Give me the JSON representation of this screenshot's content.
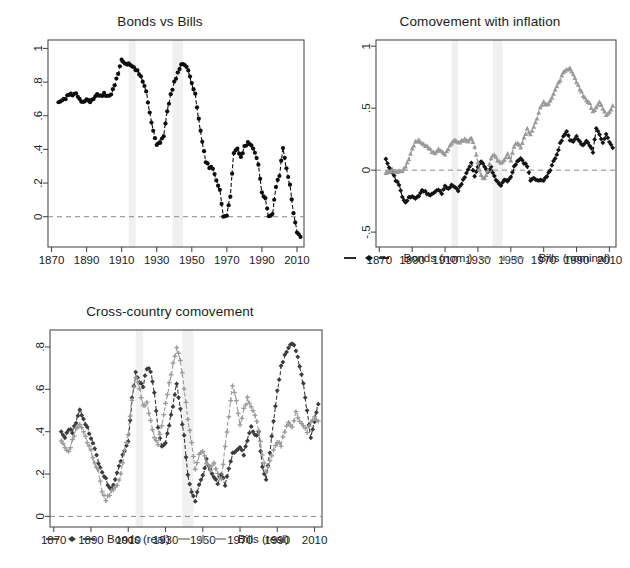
{
  "figure": {
    "panels": [
      "Bonds vs Bills",
      "Comovement with inflation",
      "Cross-country comovement"
    ]
  },
  "panel1": {
    "title": "Bonds vs Bills",
    "ytick_labels": [
      "1",
      ".8",
      ".6",
      ".4",
      ".2",
      "0"
    ],
    "xtick_labels": [
      "1870",
      "1890",
      "1910",
      "1930",
      "1950",
      "1970",
      "1990",
      "2010"
    ]
  },
  "panel2": {
    "title": "Comovement with inflation",
    "ytick_labels": [
      "1",
      ".5",
      "0",
      "-.5"
    ],
    "xtick_labels": [
      "1870",
      "1890",
      "1910",
      "1930",
      "1950",
      "1970",
      "1990",
      "2010"
    ],
    "legend": [
      {
        "label": "Bonds (nom.)",
        "color": "#141414",
        "marker": "diamond"
      },
      {
        "label": "Bills (nominal)",
        "color": "#9a9a9a",
        "marker": "triangle"
      }
    ]
  },
  "panel3": {
    "title": "Cross-country comovement",
    "ytick_labels": [
      ".8",
      ".6",
      ".4",
      ".2",
      "0"
    ],
    "xtick_labels": [
      "1870",
      "1890",
      "1910",
      "1930",
      "1950",
      "1970",
      "1990",
      "2010"
    ],
    "legend": [
      {
        "label": "Bonds (real)",
        "color": "#3c3c3c",
        "marker": "diamond"
      },
      {
        "label": "Bills (real)",
        "color": "#9a9a9a",
        "marker": "plus"
      }
    ]
  },
  "chart_data": [
    {
      "type": "line",
      "id": "bonds-vs-bills",
      "title": "Bonds vs Bills",
      "xlabel": "",
      "ylabel": "",
      "xlim": [
        1868,
        2014
      ],
      "ylim": [
        -0.18,
        1.05
      ],
      "grid": false,
      "legend_position": "none",
      "zero_reference_line": 0,
      "shaded_bands": [
        [
          1914,
          1918
        ],
        [
          1939,
          1945
        ]
      ],
      "series": [
        {
          "name": "Bonds vs Bills correlation",
          "color": "#0d0d0d",
          "marker": "filled-circle",
          "x": [
            1874,
            1876,
            1878,
            1880,
            1882,
            1884,
            1886,
            1888,
            1890,
            1892,
            1894,
            1896,
            1898,
            1900,
            1902,
            1904,
            1906,
            1908,
            1910,
            1912,
            1914,
            1916,
            1918,
            1920,
            1922,
            1924,
            1926,
            1928,
            1930,
            1932,
            1934,
            1936,
            1938,
            1940,
            1942,
            1944,
            1946,
            1948,
            1950,
            1952,
            1954,
            1956,
            1958,
            1960,
            1962,
            1964,
            1966,
            1968,
            1970,
            1972,
            1974,
            1976,
            1978,
            1980,
            1982,
            1984,
            1986,
            1988,
            1990,
            1992,
            1994,
            1996,
            1998,
            2000,
            2002,
            2004,
            2006,
            2008,
            2010,
            2012
          ],
          "y": [
            0.68,
            0.7,
            0.71,
            0.73,
            0.72,
            0.73,
            0.7,
            0.69,
            0.71,
            0.69,
            0.7,
            0.72,
            0.71,
            0.73,
            0.72,
            0.73,
            0.78,
            0.84,
            0.92,
            0.9,
            0.91,
            0.9,
            0.88,
            0.85,
            0.8,
            0.74,
            0.62,
            0.52,
            0.44,
            0.45,
            0.48,
            0.62,
            0.72,
            0.8,
            0.86,
            0.91,
            0.9,
            0.86,
            0.78,
            0.72,
            0.58,
            0.45,
            0.33,
            0.29,
            0.28,
            0.21,
            0.16,
            0.01,
            0.02,
            0.13,
            0.38,
            0.4,
            0.35,
            0.42,
            0.45,
            0.43,
            0.38,
            0.3,
            0.13,
            0.1,
            0.0,
            0.02,
            0.18,
            0.24,
            0.4,
            0.28,
            0.19,
            0.03,
            -0.08,
            -0.12
          ]
        }
      ]
    },
    {
      "type": "line",
      "id": "comovement-with-inflation",
      "title": "Comovement with inflation",
      "xlabel": "",
      "ylabel": "",
      "xlim": [
        1868,
        2014
      ],
      "ylim": [
        -0.62,
        1.05
      ],
      "grid": false,
      "legend_position": "bottom",
      "zero_reference_line": 0,
      "shaded_bands": [
        [
          1914,
          1918
        ],
        [
          1939,
          1945
        ]
      ],
      "series": [
        {
          "name": "Bonds (nom.)",
          "color": "#141414",
          "marker": "filled-diamond",
          "x": [
            1874,
            1876,
            1878,
            1880,
            1882,
            1884,
            1886,
            1888,
            1890,
            1892,
            1894,
            1896,
            1898,
            1900,
            1902,
            1904,
            1906,
            1908,
            1910,
            1912,
            1914,
            1916,
            1918,
            1920,
            1922,
            1924,
            1926,
            1928,
            1930,
            1932,
            1934,
            1936,
            1938,
            1940,
            1942,
            1944,
            1946,
            1948,
            1950,
            1952,
            1954,
            1956,
            1958,
            1960,
            1962,
            1964,
            1966,
            1968,
            1970,
            1972,
            1974,
            1976,
            1978,
            1980,
            1982,
            1984,
            1986,
            1988,
            1990,
            1992,
            1994,
            1996,
            1998,
            2000,
            2002,
            2004,
            2006,
            2008,
            2010,
            2012
          ],
          "y": [
            0.09,
            0.03,
            -0.01,
            -0.08,
            -0.12,
            -0.22,
            -0.26,
            -0.21,
            -0.2,
            -0.22,
            -0.21,
            -0.17,
            -0.18,
            -0.2,
            -0.19,
            -0.17,
            -0.16,
            -0.2,
            -0.14,
            -0.16,
            -0.12,
            -0.13,
            -0.16,
            -0.11,
            -0.06,
            0.0,
            0.06,
            -0.04,
            0.04,
            0.08,
            0.03,
            -0.02,
            0.02,
            -0.05,
            -0.09,
            -0.12,
            -0.08,
            -0.1,
            -0.07,
            0.02,
            0.07,
            0.1,
            0.06,
            0.03,
            -0.09,
            -0.07,
            -0.08,
            -0.07,
            -0.07,
            -0.04,
            0.0,
            0.07,
            0.12,
            0.22,
            0.28,
            0.32,
            0.24,
            0.22,
            0.26,
            0.22,
            0.2,
            0.24,
            0.2,
            0.14,
            0.33,
            0.28,
            0.22,
            0.3,
            0.24,
            0.18
          ]
        },
        {
          "name": "Bills (nominal)",
          "color": "#9a9a9a",
          "marker": "filled-triangle",
          "x": [
            1874,
            1876,
            1878,
            1880,
            1882,
            1884,
            1886,
            1888,
            1890,
            1892,
            1894,
            1896,
            1898,
            1900,
            1902,
            1904,
            1906,
            1908,
            1910,
            1912,
            1914,
            1916,
            1918,
            1920,
            1922,
            1924,
            1926,
            1928,
            1930,
            1932,
            1934,
            1936,
            1938,
            1940,
            1942,
            1944,
            1946,
            1948,
            1950,
            1952,
            1954,
            1956,
            1958,
            1960,
            1962,
            1964,
            1966,
            1968,
            1970,
            1972,
            1974,
            1976,
            1978,
            1980,
            1982,
            1984,
            1986,
            1988,
            1990,
            1992,
            1994,
            1996,
            1998,
            2000,
            2002,
            2004,
            2006,
            2008,
            2010,
            2012
          ],
          "y": [
            -0.02,
            -0.02,
            0.0,
            -0.01,
            0.0,
            0.0,
            0.03,
            0.08,
            0.16,
            0.22,
            0.24,
            0.22,
            0.2,
            0.18,
            0.14,
            0.13,
            0.17,
            0.16,
            0.14,
            0.18,
            0.22,
            0.24,
            0.22,
            0.24,
            0.26,
            0.24,
            0.26,
            0.18,
            0.05,
            -0.05,
            -0.07,
            0.0,
            0.1,
            0.12,
            0.07,
            0.05,
            0.08,
            0.14,
            0.09,
            0.2,
            0.22,
            0.18,
            0.26,
            0.34,
            0.3,
            0.36,
            0.42,
            0.5,
            0.54,
            0.52,
            0.56,
            0.62,
            0.68,
            0.72,
            0.78,
            0.8,
            0.82,
            0.78,
            0.72,
            0.66,
            0.6,
            0.56,
            0.54,
            0.48,
            0.52,
            0.56,
            0.5,
            0.44,
            0.46,
            0.52
          ]
        }
      ]
    },
    {
      "type": "line",
      "id": "cross-country-comovement",
      "title": "Cross-country comovement",
      "xlabel": "",
      "ylabel": "",
      "xlim": [
        1868,
        2014
      ],
      "ylim": [
        -0.05,
        0.88
      ],
      "grid": false,
      "legend_position": "bottom",
      "zero_reference_line": 0,
      "shaded_bands": [
        [
          1914,
          1918
        ],
        [
          1939,
          1945
        ]
      ],
      "series": [
        {
          "name": "Bonds (real)",
          "color": "#3c3c3c",
          "marker": "filled-diamond",
          "x": [
            1874,
            1876,
            1878,
            1880,
            1882,
            1884,
            1886,
            1888,
            1890,
            1892,
            1894,
            1896,
            1898,
            1900,
            1902,
            1904,
            1906,
            1908,
            1910,
            1912,
            1914,
            1916,
            1918,
            1920,
            1922,
            1924,
            1926,
            1928,
            1930,
            1932,
            1934,
            1936,
            1938,
            1940,
            1942,
            1944,
            1946,
            1948,
            1950,
            1952,
            1954,
            1956,
            1958,
            1960,
            1962,
            1964,
            1966,
            1968,
            1970,
            1972,
            1974,
            1976,
            1978,
            1980,
            1982,
            1984,
            1986,
            1988,
            1990,
            1992,
            1994,
            1996,
            1998,
            2000,
            2002,
            2004,
            2006,
            2008,
            2010,
            2012
          ],
          "y": [
            0.4,
            0.38,
            0.42,
            0.4,
            0.44,
            0.5,
            0.46,
            0.43,
            0.38,
            0.33,
            0.25,
            0.2,
            0.17,
            0.13,
            0.15,
            0.21,
            0.26,
            0.3,
            0.34,
            0.55,
            0.68,
            0.64,
            0.62,
            0.7,
            0.68,
            0.58,
            0.42,
            0.34,
            0.36,
            0.44,
            0.52,
            0.62,
            0.5,
            0.38,
            0.2,
            0.12,
            0.07,
            0.14,
            0.18,
            0.26,
            0.22,
            0.19,
            0.16,
            0.2,
            0.14,
            0.22,
            0.3,
            0.32,
            0.34,
            0.3,
            0.36,
            0.42,
            0.38,
            0.4,
            0.24,
            0.18,
            0.3,
            0.44,
            0.58,
            0.7,
            0.76,
            0.8,
            0.82,
            0.78,
            0.7,
            0.62,
            0.5,
            0.38,
            0.46,
            0.53
          ]
        },
        {
          "name": "Bills (real)",
          "color": "#9a9a9a",
          "marker": "plus",
          "x": [
            1874,
            1876,
            1878,
            1880,
            1882,
            1884,
            1886,
            1888,
            1890,
            1892,
            1894,
            1896,
            1898,
            1900,
            1902,
            1904,
            1906,
            1908,
            1910,
            1912,
            1914,
            1916,
            1918,
            1920,
            1922,
            1924,
            1926,
            1928,
            1930,
            1932,
            1934,
            1936,
            1938,
            1940,
            1942,
            1944,
            1946,
            1948,
            1950,
            1952,
            1954,
            1956,
            1958,
            1960,
            1962,
            1964,
            1966,
            1968,
            1970,
            1972,
            1974,
            1976,
            1978,
            1980,
            1982,
            1984,
            1986,
            1988,
            1990,
            1992,
            1994,
            1996,
            1998,
            2000,
            2002,
            2004,
            2006,
            2008,
            2010,
            2012
          ],
          "y": [
            0.36,
            0.32,
            0.3,
            0.36,
            0.42,
            0.44,
            0.4,
            0.34,
            0.3,
            0.24,
            0.22,
            0.12,
            0.08,
            0.1,
            0.12,
            0.14,
            0.2,
            0.32,
            0.4,
            0.56,
            0.66,
            0.6,
            0.52,
            0.54,
            0.46,
            0.38,
            0.34,
            0.42,
            0.52,
            0.62,
            0.72,
            0.8,
            0.74,
            0.6,
            0.45,
            0.34,
            0.22,
            0.3,
            0.32,
            0.26,
            0.22,
            0.25,
            0.2,
            0.18,
            0.34,
            0.48,
            0.62,
            0.54,
            0.42,
            0.5,
            0.56,
            0.52,
            0.48,
            0.4,
            0.28,
            0.2,
            0.26,
            0.32,
            0.36,
            0.34,
            0.4,
            0.44,
            0.42,
            0.5,
            0.46,
            0.44,
            0.4,
            0.44,
            0.46,
            0.45
          ]
        }
      ]
    }
  ]
}
